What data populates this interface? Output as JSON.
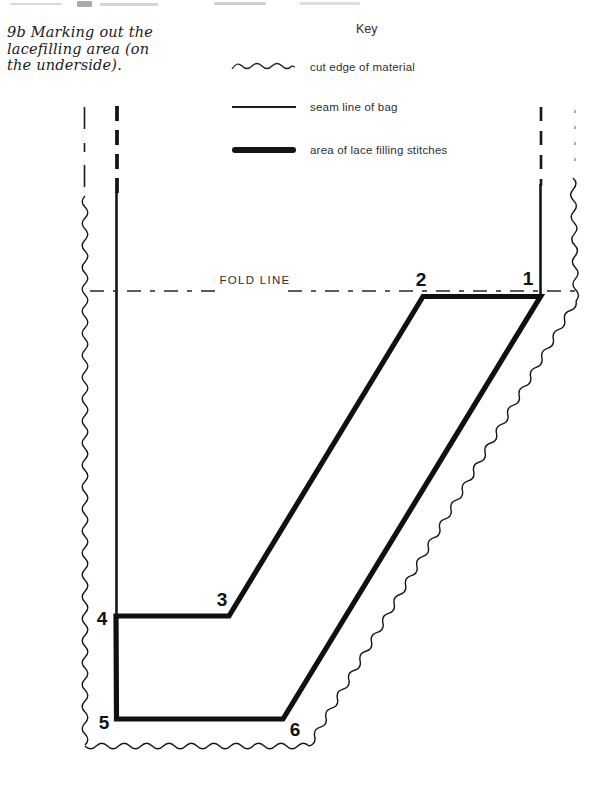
{
  "page": {
    "background": "#ffffff",
    "ink": "#161616"
  },
  "caption": {
    "lines": [
      "9b Marking out the",
      "lacefilling area (on",
      "the underside)."
    ]
  },
  "key": {
    "title": "Key",
    "items": [
      {
        "icon": "wavy-line-icon",
        "label": "cut edge of material"
      },
      {
        "icon": "thin-line-icon",
        "label": "seam line of bag"
      },
      {
        "icon": "thick-line-icon",
        "label": "area of lace filling stitches"
      }
    ]
  },
  "diagram": {
    "fold_line_label": "FOLD LINE",
    "point_labels": [
      "1",
      "2",
      "3",
      "4",
      "5",
      "6"
    ]
  }
}
